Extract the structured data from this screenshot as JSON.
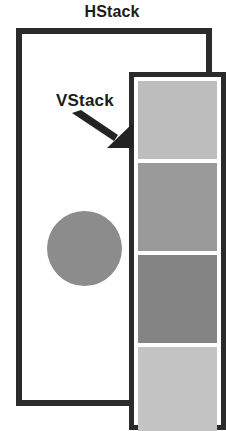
{
  "diagram": {
    "title": "HStack",
    "annotation": {
      "label": "VStack",
      "arrow_icon": "arrow-down-right-icon",
      "points_to": "vstack-frame"
    },
    "container": {
      "name": "HStack",
      "border_color": "#2b2b2b",
      "background": "#ffffff"
    },
    "children": [
      {
        "shape": "circle",
        "name": "circle-element",
        "color": "#8c8c8c"
      },
      {
        "shape": "vstack",
        "name": "VStack",
        "border_color": "#2b2b2b",
        "background": "#ffffff",
        "boxes": [
          {
            "name": "box-1",
            "color": "#bdbdbd"
          },
          {
            "name": "box-2",
            "color": "#9a9a9a"
          },
          {
            "name": "box-3",
            "color": "#848484"
          },
          {
            "name": "box-4",
            "color": "#c4c4c4"
          }
        ]
      }
    ]
  }
}
